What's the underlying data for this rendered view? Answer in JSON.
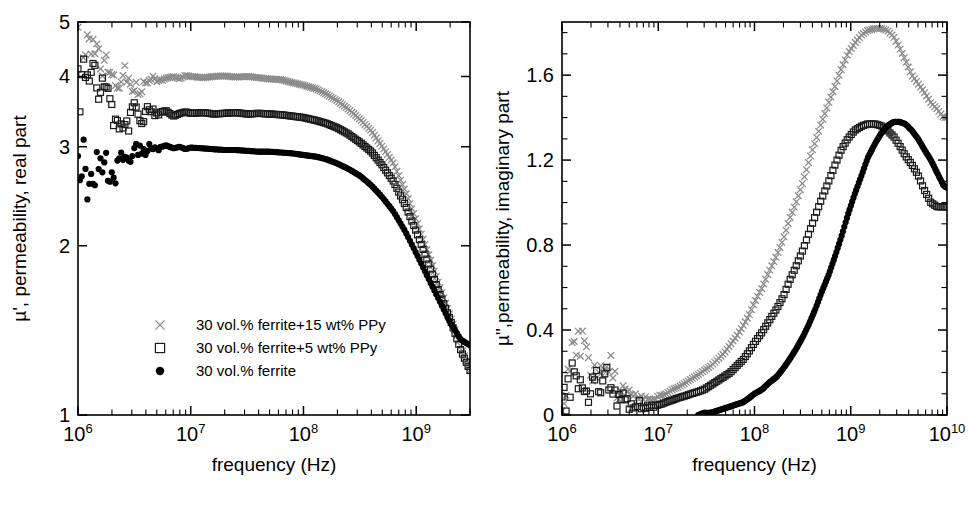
{
  "figure": {
    "type": "multi-panel-scatter",
    "background": "#ffffff",
    "panels": 2
  },
  "colors": {
    "axis": "#000000",
    "series_cross": "#8a8a8a",
    "series_square": "#1a1a1a",
    "series_circle": "#000000",
    "text": "#000000"
  },
  "legend": {
    "position": "lower-left-inside-left-panel",
    "entries": [
      {
        "marker": "cross",
        "label": "30 vol.% ferrite+15 wt% PPy"
      },
      {
        "marker": "open-square",
        "label": "30 vol.% ferrite+5 wt% PPy"
      },
      {
        "marker": "filled-circle",
        "label": "30 vol.% ferrite"
      }
    ]
  },
  "chart_data": [
    {
      "type": "scatter",
      "panel": "left",
      "title": "",
      "xlabel": "frequency (Hz)",
      "ylabel": "µ', permeability, real part",
      "xscale": "log",
      "yscale": "log",
      "xlim": [
        1000000,
        3000000000
      ],
      "ylim": [
        1,
        5
      ],
      "xticks": [
        1000000,
        10000000,
        100000000,
        1000000000
      ],
      "xticklabels": [
        "10⁶",
        "10⁷",
        "10⁸",
        "10⁹"
      ],
      "xtick_mantissa": "10",
      "xtick_exponents": [
        "6",
        "7",
        "8",
        "9"
      ],
      "yticks": [
        1,
        2,
        3,
        4,
        5
      ],
      "yticklabels": [
        "1",
        "2",
        "3",
        "4",
        "5"
      ],
      "grid": false,
      "legend_position": "lower left",
      "series": [
        {
          "name": "30 vol.% ferrite+15 wt% PPy",
          "marker": "cross",
          "color": "#8a8a8a",
          "x": [
            1000000.0,
            1050000.0,
            1100000.0,
            1200000.0,
            1300000.0,
            1450000.0,
            1600000.0,
            1800000.0,
            2000000.0,
            2200000.0,
            2500000.0,
            2800000.0,
            3200000.0,
            3600000.0,
            4000000.0,
            4500000.0,
            5000000.0,
            6000000.0,
            7000000.0,
            8000000.0,
            9000000.0,
            10000000.0,
            13000000.0,
            16000000.0,
            20000000.0,
            25000000.0,
            32000000.0,
            40000000.0,
            50000000.0,
            63000000.0,
            80000000.0,
            100000000.0,
            130000000.0,
            160000000.0,
            200000000.0,
            250000000.0,
            320000000.0,
            400000000.0,
            500000000.0,
            630000000.0,
            800000000.0,
            1000000000.0,
            1300000000.0,
            1600000000.0,
            2000000000.0,
            2500000000.0,
            3000000000.0
          ],
          "y": [
            5.0,
            4.82,
            4.68,
            4.64,
            4.45,
            4.42,
            4.28,
            4.2,
            4.1,
            3.92,
            4.05,
            3.95,
            3.88,
            3.8,
            3.95,
            4.02,
            3.93,
            3.97,
            4.0,
            3.96,
            4.02,
            4.0,
            3.98,
            4.0,
            4.01,
            3.99,
            4.0,
            3.98,
            3.96,
            3.95,
            3.9,
            3.86,
            3.8,
            3.72,
            3.62,
            3.5,
            3.35,
            3.2,
            3.0,
            2.8,
            2.5,
            2.22,
            1.92,
            1.7,
            1.5,
            1.32,
            1.2
          ]
        },
        {
          "name": "30 vol.% ferrite+5 wt% PPy",
          "marker": "open-square",
          "color": "#1a1a1a",
          "x": [
            1000000.0,
            1050000.0,
            1100000.0,
            1200000.0,
            1300000.0,
            1450000.0,
            1600000.0,
            1800000.0,
            2000000.0,
            2200000.0,
            2500000.0,
            2800000.0,
            3200000.0,
            3600000.0,
            4000000.0,
            4500000.0,
            5000000.0,
            6000000.0,
            7000000.0,
            8000000.0,
            9000000.0,
            10000000.0,
            13000000.0,
            16000000.0,
            20000000.0,
            25000000.0,
            32000000.0,
            40000000.0,
            50000000.0,
            63000000.0,
            80000000.0,
            100000000.0,
            130000000.0,
            160000000.0,
            200000000.0,
            250000000.0,
            320000000.0,
            400000000.0,
            500000000.0,
            630000000.0,
            800000000.0,
            1000000000.0,
            1300000000.0,
            1600000000.0,
            2000000000.0,
            2500000000.0,
            3000000000.0
          ],
          "y": [
            4.45,
            3.6,
            4.1,
            4.12,
            3.95,
            4.05,
            3.82,
            3.72,
            3.5,
            3.25,
            3.4,
            3.3,
            3.5,
            3.2,
            3.45,
            3.5,
            3.42,
            3.48,
            3.4,
            3.44,
            3.46,
            3.44,
            3.45,
            3.43,
            3.44,
            3.45,
            3.43,
            3.44,
            3.43,
            3.42,
            3.4,
            3.38,
            3.34,
            3.3,
            3.24,
            3.16,
            3.05,
            2.94,
            2.78,
            2.6,
            2.36,
            2.12,
            1.85,
            1.65,
            1.48,
            1.3,
            1.2
          ]
        },
        {
          "name": "30 vol.% ferrite",
          "marker": "filled-circle",
          "color": "#000000",
          "x": [
            1000000.0,
            1050000.0,
            1100000.0,
            1200000.0,
            1300000.0,
            1450000.0,
            1600000.0,
            1800000.0,
            2000000.0,
            2200000.0,
            2500000.0,
            2800000.0,
            3200000.0,
            3600000.0,
            4000000.0,
            4500000.0,
            5000000.0,
            6000000.0,
            7000000.0,
            8000000.0,
            9000000.0,
            10000000.0,
            13000000.0,
            16000000.0,
            20000000.0,
            25000000.0,
            32000000.0,
            40000000.0,
            50000000.0,
            63000000.0,
            80000000.0,
            100000000.0,
            130000000.0,
            160000000.0,
            200000000.0,
            250000000.0,
            320000000.0,
            400000000.0,
            500000000.0,
            630000000.0,
            800000000.0,
            1000000000.0,
            1300000000.0,
            1600000000.0,
            2000000000.0,
            2500000000.0,
            3000000000.0
          ],
          "y": [
            2.78,
            2.35,
            2.88,
            2.62,
            2.84,
            2.7,
            2.92,
            2.78,
            2.66,
            2.72,
            2.96,
            2.78,
            3.1,
            2.9,
            2.94,
            3.0,
            2.96,
            3.02,
            2.98,
            3.0,
            2.97,
            2.99,
            2.98,
            2.97,
            2.96,
            2.96,
            2.95,
            2.94,
            2.94,
            2.93,
            2.92,
            2.9,
            2.88,
            2.85,
            2.8,
            2.74,
            2.66,
            2.56,
            2.44,
            2.3,
            2.12,
            1.94,
            1.74,
            1.6,
            1.46,
            1.36,
            1.33
          ]
        }
      ]
    },
    {
      "type": "scatter",
      "panel": "right",
      "title": "",
      "xlabel": "frequency (Hz)",
      "ylabel": "µ\",permeability, imaginary part",
      "xscale": "log",
      "yscale": "linear",
      "xlim": [
        1000000,
        10000000000
      ],
      "ylim": [
        0,
        1.85
      ],
      "xticks": [
        1000000,
        10000000,
        100000000,
        1000000000,
        10000000000
      ],
      "xticklabels": [
        "10⁶",
        "10⁷",
        "10⁸",
        "10⁹",
        "10¹⁰"
      ],
      "xtick_mantissa": "10",
      "xtick_exponents": [
        "6",
        "7",
        "8",
        "9",
        "10"
      ],
      "yticks": [
        0,
        0.4,
        0.8,
        1.2,
        1.6
      ],
      "yticklabels": [
        "0",
        "0.4",
        "0.8",
        "1.2",
        "1.6"
      ],
      "grid": false,
      "series": [
        {
          "name": "30 vol.% ferrite+15 wt% PPy",
          "marker": "cross",
          "color": "#8a8a8a",
          "x": [
            1000000.0,
            1150000.0,
            1300000.0,
            1500000.0,
            1700000.0,
            1900000.0,
            2200000.0,
            2500000.0,
            2900000.0,
            3300000.0,
            3800000.0,
            4400000.0,
            5000000.0,
            5800000.0,
            6700000.0,
            7700000.0,
            8900000.0,
            10000000.0,
            12000000.0,
            14000000.0,
            16000000.0,
            19000000.0,
            22000000.0,
            26000000.0,
            30000000.0,
            35000000.0,
            41000000.0,
            48000000.0,
            56000000.0,
            65000000.0,
            76000000.0,
            88000000.0,
            100000000.0,
            120000000.0,
            140000000.0,
            170000000.0,
            200000000.0,
            230000000.0,
            270000000.0,
            320000000.0,
            370000000.0,
            430000000.0,
            500000000.0,
            590000000.0,
            690000000.0,
            800000000.0,
            930000000.0,
            1100000000.0,
            1300000000.0,
            1500000000.0,
            1800000000.0,
            2100000000.0,
            2400000000.0,
            2800000000.0,
            3200000000.0,
            3700000000.0,
            4300000000.0,
            5000000000.0,
            5800000000.0,
            6800000000.0,
            7900000000.0,
            9200000000.0,
            10000000000.0
          ],
          "y": [
            0.05,
            0.22,
            0.35,
            0.34,
            0.33,
            0.2,
            0.22,
            0.18,
            0.23,
            0.24,
            0.1,
            0.14,
            0.09,
            0.1,
            0.08,
            0.07,
            0.07,
            0.09,
            0.1,
            0.12,
            0.13,
            0.15,
            0.17,
            0.19,
            0.21,
            0.23,
            0.26,
            0.29,
            0.33,
            0.37,
            0.42,
            0.47,
            0.53,
            0.6,
            0.67,
            0.75,
            0.83,
            0.92,
            1.0,
            1.1,
            1.2,
            1.29,
            1.38,
            1.47,
            1.55,
            1.63,
            1.7,
            1.75,
            1.79,
            1.81,
            1.82,
            1.82,
            1.81,
            1.78,
            1.73,
            1.67,
            1.6,
            1.56,
            1.52,
            1.47,
            1.44,
            1.4,
            1.4
          ]
        },
        {
          "name": "30 vol.% ferrite+5 wt% PPy",
          "marker": "open-square",
          "color": "#1a1a1a",
          "x": [
            1000000.0,
            1150000.0,
            1300000.0,
            1500000.0,
            1700000.0,
            1900000.0,
            2200000.0,
            2500000.0,
            2900000.0,
            3300000.0,
            3800000.0,
            4400000.0,
            5000000.0,
            5800000.0,
            6700000.0,
            7700000.0,
            8900000.0,
            10000000.0,
            12000000.0,
            14000000.0,
            16000000.0,
            19000000.0,
            22000000.0,
            26000000.0,
            30000000.0,
            35000000.0,
            41000000.0,
            48000000.0,
            56000000.0,
            65000000.0,
            76000000.0,
            88000000.0,
            100000000.0,
            120000000.0,
            140000000.0,
            170000000.0,
            200000000.0,
            230000000.0,
            270000000.0,
            320000000.0,
            370000000.0,
            430000000.0,
            500000000.0,
            590000000.0,
            690000000.0,
            800000000.0,
            930000000.0,
            1100000000.0,
            1300000000.0,
            1500000000.0,
            1800000000.0,
            2100000000.0,
            2400000000.0,
            2800000000.0,
            3200000000.0,
            3700000000.0,
            4300000000.0,
            5000000000.0,
            5800000000.0,
            6800000000.0,
            7900000000.0,
            9200000000.0,
            10000000000.0
          ],
          "y": [
            0.03,
            0.12,
            0.2,
            0.16,
            0.13,
            0.1,
            0.17,
            0.12,
            0.19,
            0.1,
            0.06,
            0.08,
            0.05,
            0.06,
            0.04,
            0.04,
            0.04,
            0.05,
            0.06,
            0.07,
            0.08,
            0.09,
            0.1,
            0.11,
            0.12,
            0.14,
            0.16,
            0.18,
            0.2,
            0.23,
            0.26,
            0.3,
            0.34,
            0.39,
            0.44,
            0.5,
            0.56,
            0.63,
            0.7,
            0.78,
            0.86,
            0.94,
            1.02,
            1.1,
            1.18,
            1.25,
            1.3,
            1.34,
            1.36,
            1.37,
            1.37,
            1.36,
            1.34,
            1.31,
            1.27,
            1.22,
            1.18,
            1.13,
            1.06,
            1.0,
            0.98,
            0.98,
            0.98
          ]
        },
        {
          "name": "30 vol.% ferrite",
          "marker": "filled-circle",
          "color": "#000000",
          "x": [
            26000000.0,
            30000000.0,
            35000000.0,
            41000000.0,
            48000000.0,
            56000000.0,
            65000000.0,
            76000000.0,
            88000000.0,
            100000000.0,
            120000000.0,
            140000000.0,
            170000000.0,
            200000000.0,
            230000000.0,
            270000000.0,
            320000000.0,
            370000000.0,
            430000000.0,
            500000000.0,
            590000000.0,
            690000000.0,
            800000000.0,
            930000000.0,
            1100000000.0,
            1300000000.0,
            1500000000.0,
            1800000000.0,
            2100000000.0,
            2400000000.0,
            2800000000.0,
            3200000000.0,
            3700000000.0,
            4300000000.0,
            5000000000.0,
            5800000000.0,
            6800000000.0,
            7900000000.0,
            9200000000.0,
            10000000000.0
          ],
          "y": [
            0.0,
            0.01,
            0.01,
            0.02,
            0.03,
            0.04,
            0.05,
            0.06,
            0.08,
            0.1,
            0.12,
            0.15,
            0.18,
            0.22,
            0.26,
            0.31,
            0.37,
            0.43,
            0.5,
            0.58,
            0.66,
            0.75,
            0.84,
            0.94,
            1.04,
            1.13,
            1.21,
            1.28,
            1.33,
            1.36,
            1.38,
            1.38,
            1.37,
            1.34,
            1.3,
            1.25,
            1.2,
            1.14,
            1.08,
            1.07
          ]
        }
      ]
    }
  ]
}
